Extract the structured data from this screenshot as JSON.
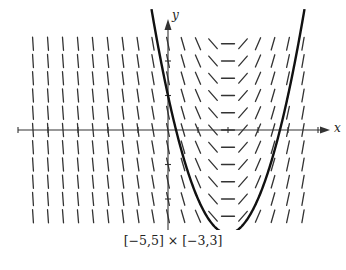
{
  "chart_data": {
    "type": "slope_field",
    "title": "",
    "caption": "[−5,5] × [−3,3]",
    "xlabel": "x",
    "ylabel": "y",
    "xlim": [
      -5,
      5
    ],
    "ylim": [
      -3,
      3
    ],
    "grid": false,
    "slope_field": {
      "columns_x": [
        -4.5,
        -4,
        -3.5,
        -3,
        -2.5,
        -2,
        -1.5,
        -1,
        -0.5,
        0,
        0.5,
        1,
        1.5,
        2,
        2.5,
        3,
        3.5,
        4,
        4.5
      ],
      "rows_y": [
        2.5,
        2,
        1.5,
        1,
        0.5,
        0,
        -0.5,
        -1,
        -1.5,
        -2,
        -2.5
      ],
      "slope_rule": "dy/dx = 2(x - 2)",
      "notes": "slopes depend only on x; horizontal at x = 2"
    },
    "solution_curve": {
      "type": "parabola",
      "equation": "y = (x - 2)^2 - 3",
      "vertex": [
        2,
        -3
      ],
      "x_intercepts": [
        0.27,
        3.73
      ]
    }
  },
  "figure": {
    "caption": "[−5,5] × [−3,3]",
    "x_axis_label": "x",
    "y_axis_label": "y"
  }
}
